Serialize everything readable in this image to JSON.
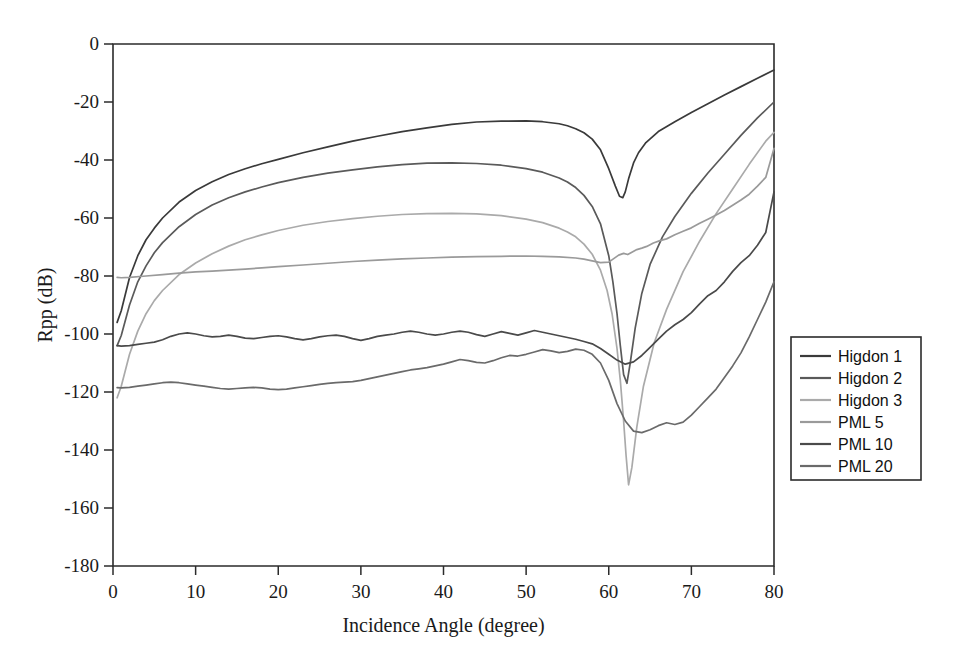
{
  "chart_data": {
    "type": "line",
    "title": "",
    "xlabel": "Incidence Angle (degree)",
    "ylabel": "Rpp (dB)",
    "xlim": [
      0,
      80
    ],
    "ylim": [
      -180,
      0
    ],
    "xticks": [
      0,
      10,
      20,
      30,
      40,
      50,
      60,
      70,
      80
    ],
    "yticks": [
      0,
      -20,
      -40,
      -60,
      -80,
      -100,
      -120,
      -140,
      -160,
      -180
    ],
    "xticklabels": [
      "0",
      "10",
      "20",
      "30",
      "40",
      "50",
      "60",
      "70",
      "80"
    ],
    "yticklabels": [
      "0",
      "-20",
      "-40",
      "-60",
      "-80",
      "-100",
      "-120",
      "-140",
      "-160",
      "-180"
    ],
    "grid": false,
    "legend_position": "right-outside",
    "series": [
      {
        "name": "Higdon 1",
        "color": "#3a3a3a",
        "x": [
          0.5,
          1,
          2,
          3,
          4,
          5,
          6,
          8,
          10,
          12,
          14,
          16,
          18,
          20,
          23,
          26,
          29,
          32,
          35,
          38,
          41,
          44,
          47,
          50,
          52,
          54,
          55,
          56,
          57,
          58,
          59,
          60,
          60.8,
          61.3,
          61.7,
          62,
          62.4,
          63,
          63.6,
          64.5,
          66,
          68,
          70,
          72,
          74,
          76,
          78,
          80
        ],
        "y": [
          -96.0,
          -92.0,
          -80.5,
          -73.0,
          -67.5,
          -63.5,
          -60.0,
          -54.5,
          -50.5,
          -47.5,
          -45.0,
          -43.0,
          -41.3,
          -39.8,
          -37.5,
          -35.5,
          -33.5,
          -31.8,
          -30.2,
          -28.9,
          -27.7,
          -26.9,
          -26.6,
          -26.5,
          -26.8,
          -27.5,
          -28.2,
          -29.2,
          -30.6,
          -32.8,
          -36.5,
          -43.0,
          -49.0,
          -52.5,
          -53.0,
          -51.0,
          -46.5,
          -41.0,
          -37.5,
          -34.0,
          -30.2,
          -26.8,
          -23.6,
          -20.6,
          -17.6,
          -14.7,
          -11.8,
          -9.0
        ]
      },
      {
        "name": "Higdon 2",
        "color": "#5a5a5a",
        "x": [
          0.5,
          1,
          2,
          3,
          4,
          5,
          6,
          8,
          10,
          12,
          14,
          16,
          18,
          20,
          23,
          26,
          29,
          32,
          35,
          38,
          41,
          44,
          47,
          50,
          52,
          54,
          55,
          56,
          57,
          58,
          59,
          60,
          60.5,
          61,
          61.4,
          61.8,
          62.2,
          62.6,
          63.2,
          64,
          65,
          66.5,
          68,
          70,
          72,
          74,
          76,
          78,
          80
        ],
        "y": [
          -104.0,
          -100.5,
          -90.0,
          -82.0,
          -76.5,
          -72.0,
          -68.5,
          -63.0,
          -58.8,
          -55.5,
          -53.0,
          -51.0,
          -49.3,
          -47.8,
          -46.0,
          -44.5,
          -43.4,
          -42.4,
          -41.6,
          -41.1,
          -41.0,
          -41.2,
          -41.8,
          -43.0,
          -44.2,
          -46.2,
          -47.6,
          -49.5,
          -52.2,
          -56.0,
          -62.0,
          -73.0,
          -82.0,
          -93.0,
          -104.0,
          -114.0,
          -117.0,
          -110.0,
          -98.0,
          -86.0,
          -76.0,
          -66.5,
          -59.5,
          -51.5,
          -44.5,
          -38.0,
          -31.5,
          -25.5,
          -20.0
        ]
      },
      {
        "name": "Higdon 3",
        "color": "#aaaaaa",
        "x": [
          0.5,
          1,
          2,
          3,
          4,
          5,
          6,
          8,
          10,
          12,
          14,
          16,
          18,
          20,
          23,
          26,
          29,
          32,
          35,
          38,
          41,
          44,
          47,
          50,
          52,
          54,
          55,
          56,
          57,
          58,
          59,
          59.8,
          60.4,
          61,
          61.4,
          61.8,
          62.1,
          62.4,
          62.8,
          63.4,
          64.2,
          65.5,
          67,
          69,
          71,
          73,
          75,
          77,
          79,
          80
        ],
        "y": [
          -122.0,
          -118.0,
          -107.0,
          -99.0,
          -93.0,
          -88.5,
          -85.0,
          -79.5,
          -75.5,
          -72.3,
          -69.7,
          -67.5,
          -65.8,
          -64.3,
          -62.5,
          -61.2,
          -60.2,
          -59.4,
          -58.8,
          -58.5,
          -58.4,
          -58.6,
          -59.2,
          -60.4,
          -61.6,
          -63.5,
          -64.8,
          -66.5,
          -69.0,
          -72.5,
          -78.0,
          -85.0,
          -93.0,
          -105.0,
          -116.0,
          -130.0,
          -142.0,
          -152.0,
          -146.0,
          -132.0,
          -118.0,
          -103.0,
          -91.5,
          -78.5,
          -68.0,
          -58.5,
          -50.0,
          -41.5,
          -33.5,
          -30.5
        ]
      },
      {
        "name": "PML 5",
        "color": "#9a9a9a",
        "x": [
          0.5,
          1,
          2,
          4,
          6,
          8,
          10,
          12,
          14,
          16,
          18,
          20,
          23,
          26,
          29,
          32,
          35,
          38,
          41,
          44,
          47,
          50,
          52,
          54,
          56,
          57,
          58,
          59,
          60,
          60.6,
          61.2,
          61.8,
          62.3,
          62.8,
          63.4,
          64,
          64.6,
          65.4,
          66.2,
          67,
          68,
          69,
          70,
          71,
          72,
          73,
          74,
          75,
          76,
          77,
          78,
          79,
          80
        ],
        "y": [
          -80.5,
          -80.6,
          -80.5,
          -80.0,
          -79.5,
          -79.0,
          -78.6,
          -78.3,
          -78.0,
          -77.6,
          -77.2,
          -76.8,
          -76.2,
          -75.6,
          -75.0,
          -74.5,
          -74.1,
          -73.8,
          -73.5,
          -73.3,
          -73.2,
          -73.1,
          -73.2,
          -73.4,
          -73.8,
          -74.2,
          -74.8,
          -75.4,
          -75.2,
          -74.0,
          -72.8,
          -72.2,
          -72.6,
          -71.8,
          -70.9,
          -70.4,
          -69.8,
          -68.6,
          -67.8,
          -67.2,
          -65.8,
          -64.6,
          -63.4,
          -61.8,
          -60.4,
          -59.0,
          -57.4,
          -55.6,
          -53.8,
          -51.8,
          -49.0,
          -46.0,
          -36.0
        ]
      },
      {
        "name": "PML 10",
        "color": "#4a4a4a",
        "x": [
          0.5,
          1,
          2,
          3,
          4,
          5,
          6,
          7,
          8,
          9,
          10,
          11,
          12,
          13,
          14,
          15,
          16,
          17,
          18,
          19,
          20,
          21,
          22,
          23,
          24,
          25,
          26,
          27,
          28,
          29,
          30,
          31,
          32,
          33,
          34,
          35,
          36,
          37,
          38,
          39,
          40,
          41,
          42,
          43,
          44,
          45,
          46,
          47,
          48,
          49,
          50,
          51,
          52,
          53,
          54,
          55,
          56,
          57,
          58,
          59,
          60,
          61,
          62,
          63,
          64,
          65,
          66,
          67,
          68,
          69,
          70,
          71,
          72,
          73,
          74,
          75,
          76,
          77,
          78,
          79,
          80
        ],
        "y": [
          -104.0,
          -104.2,
          -104.0,
          -103.6,
          -103.2,
          -102.8,
          -102.0,
          -100.8,
          -100.0,
          -99.6,
          -100.0,
          -100.6,
          -101.0,
          -100.8,
          -100.4,
          -100.8,
          -101.4,
          -101.6,
          -101.2,
          -100.8,
          -100.6,
          -101.0,
          -101.6,
          -102.0,
          -101.6,
          -101.0,
          -100.6,
          -100.4,
          -100.8,
          -101.6,
          -102.2,
          -101.6,
          -100.8,
          -100.4,
          -100.0,
          -99.4,
          -99.0,
          -99.4,
          -100.0,
          -100.4,
          -100.0,
          -99.4,
          -99.0,
          -99.4,
          -100.2,
          -100.8,
          -100.0,
          -99.2,
          -99.8,
          -100.4,
          -99.6,
          -98.8,
          -99.4,
          -100.0,
          -100.6,
          -101.2,
          -101.8,
          -102.6,
          -103.4,
          -105.0,
          -107.0,
          -109.0,
          -110.4,
          -109.6,
          -107.4,
          -104.6,
          -101.8,
          -99.0,
          -96.8,
          -95.0,
          -92.6,
          -89.6,
          -86.8,
          -85.0,
          -82.0,
          -78.4,
          -75.4,
          -73.0,
          -69.4,
          -65.0,
          -51.0
        ]
      },
      {
        "name": "PML 20",
        "color": "#6a6a6a",
        "x": [
          0.5,
          1,
          2,
          3,
          4,
          5,
          6,
          7,
          8,
          9,
          10,
          11,
          12,
          13,
          14,
          15,
          16,
          17,
          18,
          19,
          20,
          21,
          22,
          23,
          24,
          25,
          26,
          27,
          28,
          29,
          30,
          31,
          32,
          33,
          34,
          35,
          36,
          37,
          38,
          39,
          40,
          41,
          42,
          43,
          44,
          45,
          46,
          47,
          48,
          49,
          50,
          51,
          52,
          53,
          54,
          55,
          56,
          57,
          58,
          59,
          60,
          61,
          62,
          63,
          64,
          65,
          66,
          67,
          68,
          69,
          70,
          71,
          72,
          73,
          74,
          75,
          76,
          77,
          78,
          79,
          80
        ],
        "y": [
          -118.5,
          -118.6,
          -118.4,
          -118.0,
          -117.6,
          -117.2,
          -116.8,
          -116.6,
          -116.8,
          -117.2,
          -117.6,
          -118.0,
          -118.4,
          -118.8,
          -119.0,
          -118.8,
          -118.6,
          -118.4,
          -118.6,
          -119.0,
          -119.2,
          -119.0,
          -118.6,
          -118.2,
          -117.8,
          -117.4,
          -117.0,
          -116.8,
          -116.6,
          -116.4,
          -116.0,
          -115.4,
          -114.8,
          -114.2,
          -113.6,
          -113.0,
          -112.4,
          -112.0,
          -111.6,
          -111.0,
          -110.4,
          -109.6,
          -108.8,
          -109.2,
          -109.8,
          -110.0,
          -109.2,
          -108.2,
          -107.4,
          -107.6,
          -107.0,
          -106.2,
          -105.4,
          -105.8,
          -106.4,
          -106.0,
          -105.2,
          -105.6,
          -107.0,
          -110.0,
          -116.0,
          -124.0,
          -130.0,
          -133.5,
          -134.0,
          -133.0,
          -131.6,
          -130.6,
          -131.2,
          -130.4,
          -128.0,
          -125.0,
          -122.0,
          -119.0,
          -115.0,
          -111.0,
          -106.5,
          -101.0,
          -95.0,
          -89.0,
          -82.0
        ]
      }
    ]
  },
  "legend": {
    "entries": [
      "Higdon 1",
      "Higdon 2",
      "Higdon 3",
      "PML 5",
      "PML 10",
      "PML 20"
    ]
  }
}
